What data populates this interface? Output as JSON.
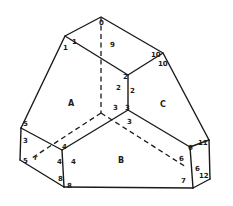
{
  "figure": {
    "faces": [
      {
        "id": "A",
        "label": "A",
        "x": 68,
        "y": 106
      },
      {
        "id": "B",
        "label": "B",
        "x": 118,
        "y": 163
      },
      {
        "id": "C",
        "label": "C",
        "x": 160,
        "y": 107
      }
    ],
    "vertex_labels": [
      {
        "label": "0",
        "x": 99,
        "y": 25
      },
      {
        "label": "1",
        "x": 72,
        "y": 44
      },
      {
        "label": "1",
        "x": 63,
        "y": 50
      },
      {
        "label": "9",
        "x": 110,
        "y": 47
      },
      {
        "label": "2",
        "x": 123,
        "y": 79
      },
      {
        "label": "2",
        "x": 116,
        "y": 90
      },
      {
        "label": "2",
        "x": 130,
        "y": 93
      },
      {
        "label": "10",
        "x": 151,
        "y": 57
      },
      {
        "label": "10",
        "x": 158,
        "y": 66
      },
      {
        "label": "3",
        "x": 113,
        "y": 110
      },
      {
        "label": "3",
        "x": 125,
        "y": 110
      },
      {
        "label": "3",
        "x": 127,
        "y": 124
      },
      {
        "label": "5",
        "x": 23,
        "y": 126
      },
      {
        "label": "3",
        "x": 23,
        "y": 143
      },
      {
        "label": "4",
        "x": 62,
        "y": 149
      },
      {
        "label": "4",
        "x": 57,
        "y": 164
      },
      {
        "label": "4",
        "x": 71,
        "y": 164
      },
      {
        "label": "5",
        "x": 23,
        "y": 163
      },
      {
        "label": "r",
        "x": 34,
        "y": 160
      },
      {
        "label": "8",
        "x": 58,
        "y": 181
      },
      {
        "label": "8",
        "x": 67,
        "y": 188
      },
      {
        "label": "6",
        "x": 188,
        "y": 150
      },
      {
        "label": "11",
        "x": 198,
        "y": 145
      },
      {
        "label": "6",
        "x": 179,
        "y": 161
      },
      {
        "label": "6",
        "x": 195,
        "y": 171
      },
      {
        "label": "7",
        "x": 181,
        "y": 183
      },
      {
        "label": "12",
        "x": 199,
        "y": 178
      }
    ]
  }
}
